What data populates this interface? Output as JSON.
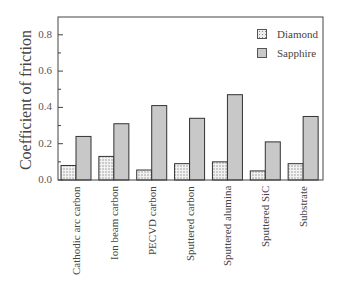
{
  "chart_data": {
    "type": "bar",
    "title": "",
    "xlabel": "",
    "ylabel": "Coefficient of friction",
    "ylim": [
      0.0,
      0.9
    ],
    "yticks": [
      "0.0",
      "0.2",
      "0.4",
      "0.6",
      "0.8"
    ],
    "grid": false,
    "legend_position": "upper right",
    "categories": [
      "Cathodic arc carbon",
      "Ion beam carbon",
      "PECVD carbon",
      "Sputtered carbon",
      "Sputtered alumina",
      "Sputtered SiC",
      "Substrate"
    ],
    "series": [
      {
        "name": "Diamond",
        "pattern": "dotted",
        "color": "#e6e6e6",
        "values": [
          0.08,
          0.13,
          0.055,
          0.09,
          0.1,
          0.05,
          0.09
        ]
      },
      {
        "name": "Sapphire",
        "pattern": "solid",
        "color": "#c8c8c8",
        "values": [
          0.24,
          0.31,
          0.41,
          0.34,
          0.47,
          0.21,
          0.35
        ]
      }
    ]
  }
}
